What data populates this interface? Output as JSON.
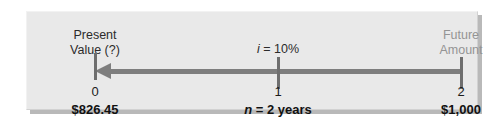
{
  "diagram": {
    "type": "timeline",
    "direction": "right-to-left",
    "colors": {
      "panel_background": "#e9e9e9",
      "arrow": "#7e7e7e",
      "tick": "#6e6e6e",
      "label_dark": "#2b2b2b",
      "label_light": "#949494",
      "value_text": "#111111"
    },
    "left_label": {
      "line1": "Present",
      "line2": "Value (?)"
    },
    "right_label": {
      "line1": "Future",
      "line2": "Amount"
    },
    "rate": {
      "symbol": "i",
      "equals": " = ",
      "value": "10%",
      "full": "i = 10%"
    },
    "term": {
      "symbol": "n",
      "equals": " = ",
      "value": "2 years",
      "full": "n = 2 years"
    },
    "periods": [
      {
        "index": "0",
        "amount": "$826.45"
      },
      {
        "index": "1",
        "amount": ""
      },
      {
        "index": "2",
        "amount": "$1,000"
      }
    ]
  }
}
